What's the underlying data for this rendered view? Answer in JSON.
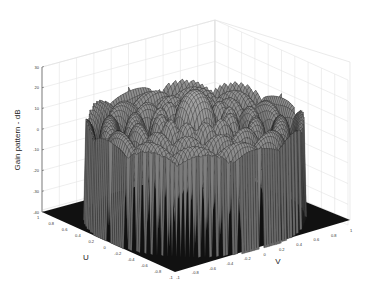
{
  "chart_data": {
    "type": "surface3d",
    "title": "",
    "zlabel": "Gain pattern - dB",
    "xlabel": "U",
    "ylabel": "V",
    "zlim": [
      -40,
      30
    ],
    "xlim": [
      -1,
      1
    ],
    "ylim": [
      -1,
      1
    ],
    "z_ticks": [
      "30",
      "20",
      "10",
      "0",
      "-10",
      "-20",
      "-30",
      "-40"
    ],
    "u_ticks": [
      "1",
      "0.8",
      "0.6",
      "0.4",
      "0.2",
      "0",
      "-0.2",
      "-0.4",
      "-0.6",
      "-0.8",
      "-1"
    ],
    "v_ticks": [
      "-1",
      "-0.8",
      "-0.6",
      "-0.4",
      "-0.2",
      "0",
      "0.2",
      "0.4",
      "0.6",
      "0.8",
      "1"
    ],
    "grid": true,
    "colormap": "grayscale mesh",
    "peak_db": 22,
    "floor_db": -40
  }
}
